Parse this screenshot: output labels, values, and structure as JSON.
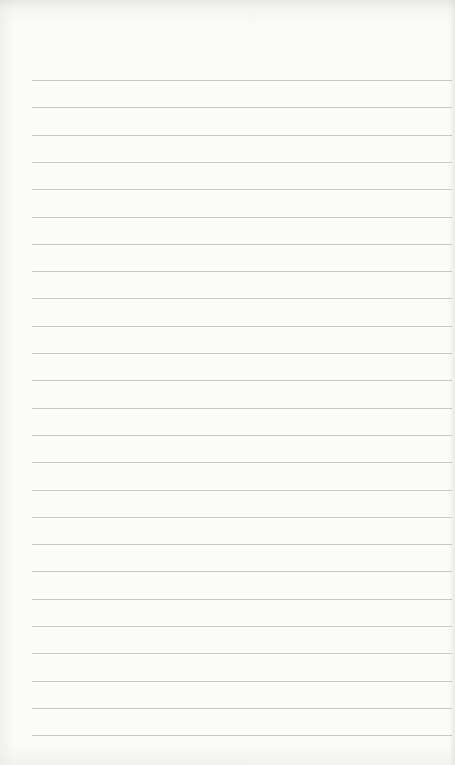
{
  "paper": {
    "type": "lined-notebook-page",
    "background_color": "#fbfbf9",
    "rule_color": "#c9c9c6",
    "rule_count": 25,
    "rule_start_y": 80,
    "rule_spacing": 27.3,
    "rule_left_x": 32,
    "rule_right_x": 452
  }
}
